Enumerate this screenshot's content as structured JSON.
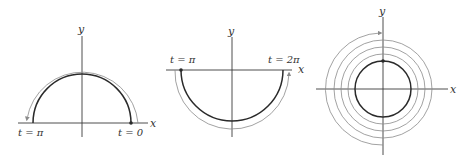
{
  "panels": [
    {
      "id": "upper-semicircle",
      "axis_labels": {
        "x": "x",
        "y": "y"
      },
      "point_labels": {
        "start": "t = 0",
        "end": "t = π"
      }
    },
    {
      "id": "lower-semicircle",
      "axis_labels": {
        "x": "x",
        "y": "y"
      },
      "point_labels": {
        "start": "t = π",
        "end": "t = 2π"
      }
    },
    {
      "id": "full-circle-repeated",
      "axis_labels": {
        "x": "x",
        "y": "y"
      }
    }
  ],
  "colors": {
    "curve": "#2a2a2a",
    "path": "#8a8a8a",
    "axis": "#3a3a3a"
  }
}
